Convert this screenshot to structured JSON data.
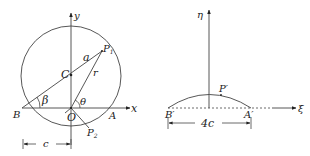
{
  "left_figure": {
    "axis_labels": {
      "x": "x",
      "y": "y"
    },
    "points": {
      "center": "C",
      "origin": "O",
      "B": "B",
      "A": "A",
      "P1": "P",
      "P1_sub": "1",
      "P2": "P",
      "P2_sub": "2"
    },
    "segment_labels": {
      "radius_a": "a",
      "r": "r"
    },
    "angles": {
      "beta": "β",
      "theta": "θ"
    },
    "dimension": "c"
  },
  "right_figure": {
    "axis_labels": {
      "xi": "ξ",
      "eta": "η"
    },
    "points": {
      "B_prime": "B′",
      "A_prime": "A′",
      "P_prime": "P′"
    },
    "dimension": "4c"
  }
}
